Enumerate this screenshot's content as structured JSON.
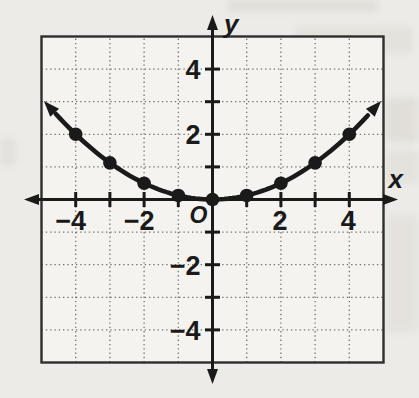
{
  "page": {
    "paper_color": "#edebe7",
    "plot_bg": "#f4f3ef",
    "ink": "#1a1a1a",
    "grid_color": "#757575",
    "frame_color": "#2e2e2e"
  },
  "chart_data": {
    "type": "scatter-line",
    "title": "",
    "xlabel": "x",
    "ylabel": "y",
    "origin_label": "O",
    "xlim": [
      -5,
      5
    ],
    "ylim": [
      -5,
      5
    ],
    "grid": "dotted",
    "grid_step": 1,
    "tick_step": 1,
    "x_tick_labels": [
      {
        "value": -4,
        "label": "−4"
      },
      {
        "value": -2,
        "label": "−2"
      },
      {
        "value": 2,
        "label": "2"
      },
      {
        "value": 4,
        "label": "4"
      }
    ],
    "y_tick_labels": [
      {
        "value": 4,
        "label": "4"
      },
      {
        "value": 2,
        "label": "2"
      },
      {
        "value": -2,
        "label": "−2"
      },
      {
        "value": -4,
        "label": "−4"
      }
    ],
    "points": [
      {
        "x": -4,
        "y": 2
      },
      {
        "x": -3,
        "y": 1.125
      },
      {
        "x": -2,
        "y": 0.5
      },
      {
        "x": -1,
        "y": 0.125
      },
      {
        "x": 0,
        "y": 0
      },
      {
        "x": 1,
        "y": 0.125
      },
      {
        "x": 2,
        "y": 0.5
      },
      {
        "x": 3,
        "y": 1.125
      },
      {
        "x": 4,
        "y": 2
      }
    ],
    "curve": {
      "kind": "parabola",
      "a": 0.125,
      "b": 0,
      "c": 0,
      "domain": [
        -4.58,
        4.58
      ]
    }
  }
}
